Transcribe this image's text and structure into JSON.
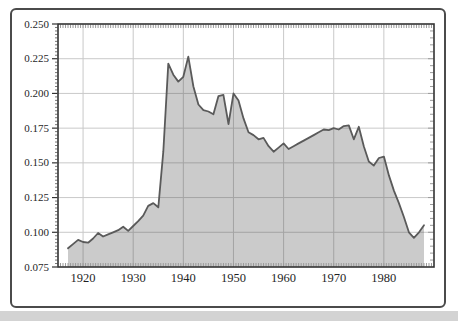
{
  "page": {
    "background": "#ffffff",
    "card_border_color": "#4b4b4b",
    "bottom_strip_color": "#d3d3d3"
  },
  "chart_data": {
    "type": "area",
    "x": [
      1917,
      1918,
      1919,
      1920,
      1921,
      1922,
      1923,
      1924,
      1925,
      1926,
      1927,
      1928,
      1929,
      1930,
      1931,
      1932,
      1933,
      1934,
      1935,
      1936,
      1937,
      1938,
      1939,
      1940,
      1941,
      1942,
      1943,
      1944,
      1945,
      1946,
      1947,
      1948,
      1949,
      1950,
      1951,
      1952,
      1953,
      1954,
      1955,
      1956,
      1957,
      1958,
      1959,
      1960,
      1961,
      1962,
      1963,
      1964,
      1965,
      1966,
      1967,
      1968,
      1969,
      1970,
      1971,
      1972,
      1973,
      1974,
      1975,
      1976,
      1977,
      1978,
      1979,
      1980,
      1981,
      1982,
      1983,
      1984,
      1985,
      1986,
      1987,
      1988
    ],
    "values": [
      0.0885,
      0.0915,
      0.0945,
      0.093,
      0.0925,
      0.0955,
      0.0995,
      0.097,
      0.0985,
      0.1,
      0.1015,
      0.104,
      0.101,
      0.1045,
      0.108,
      0.112,
      0.119,
      0.121,
      0.118,
      0.158,
      0.2215,
      0.2135,
      0.2085,
      0.212,
      0.2265,
      0.205,
      0.192,
      0.188,
      0.187,
      0.185,
      0.198,
      0.199,
      0.178,
      0.2,
      0.195,
      0.182,
      0.172,
      0.17,
      0.167,
      0.168,
      0.162,
      0.158,
      0.161,
      0.164,
      0.16,
      0.162,
      0.164,
      0.166,
      0.168,
      0.17,
      0.172,
      0.174,
      0.1735,
      0.175,
      0.174,
      0.1765,
      0.177,
      0.167,
      0.176,
      0.162,
      0.151,
      0.148,
      0.1535,
      0.1545,
      0.141,
      0.13,
      0.121,
      0.111,
      0.1,
      0.096,
      0.1,
      0.105
    ],
    "xlim": [
      1915,
      1990
    ],
    "ylim": [
      0.075,
      0.25
    ],
    "xticks": [
      1920,
      1930,
      1940,
      1950,
      1960,
      1970,
      1980
    ],
    "yticks": [
      0.075,
      0.1,
      0.125,
      0.15,
      0.175,
      0.2,
      0.225,
      0.25
    ],
    "ytick_labels": [
      "0.075",
      "0.100",
      "0.125",
      "0.150",
      "0.175",
      "0.200",
      "0.225",
      "0.250"
    ],
    "xtick_labels": [
      "1920",
      "1930",
      "1940",
      "1950",
      "1960",
      "1970",
      "1980"
    ],
    "grid": true,
    "legend": false,
    "fill_color": "rgba(70,70,70,0.28)",
    "line_color": "#5a5a5a",
    "grid_color": "#c9c9c9",
    "frame_color": "#333333",
    "minor_tick_color": "#9b9b9b",
    "left_minor_tick_color": "#777777",
    "major_tick_color": "#333333",
    "label_color": "#1f1f1f"
  }
}
